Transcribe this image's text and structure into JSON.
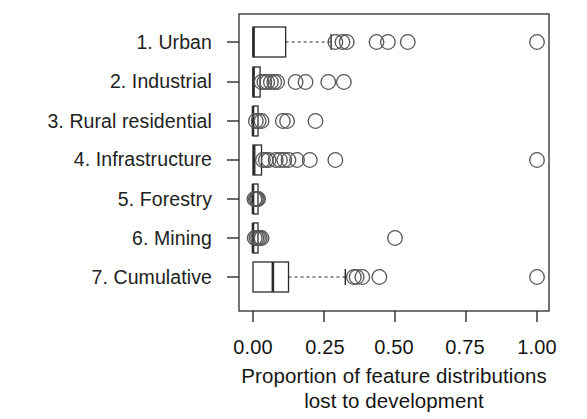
{
  "chart_data": {
    "type": "box",
    "orientation": "horizontal",
    "title": "",
    "xlabel_line1": "Proportion of feature distributions",
    "xlabel_line2": "lost to development",
    "ylabel": "",
    "xlim": [
      -0.045,
      1.045
    ],
    "xticks": [
      0.0,
      0.25,
      0.5,
      0.75,
      1.0
    ],
    "xticklabels": [
      "0.00",
      "0.25",
      "0.50",
      "0.75",
      "1.00"
    ],
    "grid": false,
    "legend": false,
    "categories": [
      "1. Urban",
      "2. Industrial",
      "3. Rural residential",
      "4. Infrastructure",
      "5. Forestry",
      "6. Mining",
      "7. Cumulative"
    ],
    "boxes": [
      {
        "category": "1. Urban",
        "min": 0.0,
        "q1": 0.0,
        "median": 0.002,
        "q3": 0.115,
        "whisker_low": 0.0,
        "whisker_high": 0.275,
        "outliers": [
          0.29,
          0.315,
          0.33,
          0.435,
          0.475,
          0.545,
          1.0
        ]
      },
      {
        "category": "2. Industrial",
        "min": 0.0,
        "q1": 0.0,
        "median": 0.002,
        "q3": 0.025,
        "whisker_low": 0.0,
        "whisker_high": 0.025,
        "outliers": [
          0.03,
          0.04,
          0.05,
          0.063,
          0.075,
          0.085,
          0.15,
          0.185,
          0.265,
          0.32
        ]
      },
      {
        "category": "3. Rural residential",
        "min": 0.0,
        "q1": 0.0,
        "median": 0.0,
        "q3": 0.004,
        "whisker_low": 0.0,
        "whisker_high": 0.004,
        "outliers": [
          0.01,
          0.02,
          0.03,
          0.105,
          0.12,
          0.22
        ]
      },
      {
        "category": "4. Infrastructure",
        "min": 0.0,
        "q1": 0.0,
        "median": 0.004,
        "q3": 0.03,
        "whisker_low": 0.0,
        "whisker_high": 0.03,
        "outliers": [
          0.035,
          0.045,
          0.055,
          0.08,
          0.095,
          0.11,
          0.125,
          0.155,
          0.2,
          0.29,
          1.0
        ]
      },
      {
        "category": "5. Forestry",
        "min": 0.0,
        "q1": 0.0,
        "median": 0.0,
        "q3": 0.006,
        "whisker_low": 0.0,
        "whisker_high": 0.006,
        "outliers": [
          0.005,
          0.01,
          0.014,
          0.018
        ]
      },
      {
        "category": "6. Mining",
        "min": 0.0,
        "q1": 0.0,
        "median": 0.0,
        "q3": 0.006,
        "whisker_low": 0.0,
        "whisker_high": 0.006,
        "outliers": [
          0.006,
          0.012,
          0.018,
          0.024,
          0.03,
          0.5
        ]
      },
      {
        "category": "7. Cumulative",
        "min": 0.0,
        "q1": 0.0,
        "median": 0.07,
        "q3": 0.125,
        "whisker_low": 0.0,
        "whisker_high": 0.325,
        "outliers": [
          0.355,
          0.365,
          0.385,
          0.445,
          1.0
        ]
      }
    ]
  },
  "axis": {
    "tick_0": "0.00",
    "tick_1": "0.25",
    "tick_2": "0.50",
    "tick_3": "0.75",
    "tick_4": "1.00",
    "title_line1": "Proportion of feature distributions",
    "title_line2": "lost to development"
  },
  "labels": {
    "row_0": "1. Urban",
    "row_1": "2. Industrial",
    "row_2": "3. Rural residential",
    "row_3": "4. Infrastructure",
    "row_4": "5. Forestry",
    "row_5": "6. Mining",
    "row_6": "7. Cumulative"
  },
  "style": {
    "line_color": "#2b2b2b",
    "outlier_stroke": "#555555",
    "background": "#ffffff"
  }
}
